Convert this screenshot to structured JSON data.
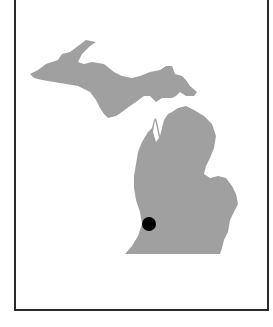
{
  "map": {
    "region": "Michigan",
    "land_color": "#a0a0a0",
    "background_color": "#ffffff",
    "border_color": "#2a2a2a",
    "marker": {
      "shape": "circle",
      "color": "#000000",
      "approx_location": "southwestern Lower Peninsula"
    }
  },
  "caption": {
    "text": ""
  }
}
